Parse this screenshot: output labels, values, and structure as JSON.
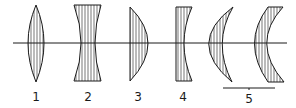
{
  "diagram": {
    "axis": {
      "x1": 13,
      "x2": 287,
      "y": 43
    },
    "lenses": [
      {
        "id": "1",
        "label": "1",
        "shape": "biconvex",
        "label_x": 36
      },
      {
        "id": "2",
        "label": "2",
        "shape": "biconcave",
        "label_x": 88
      },
      {
        "id": "3",
        "label": "3",
        "shape": "plano-convex",
        "label_x": 138
      },
      {
        "id": "4",
        "label": "4",
        "shape": "plano-concave",
        "label_x": 183
      },
      {
        "id": "5a",
        "label": "",
        "shape": "positive-meniscus",
        "label_x": 220
      },
      {
        "id": "5b",
        "label": "",
        "shape": "negative-meniscus",
        "label_x": 272
      }
    ],
    "group_bracket": {
      "label": "5",
      "x1": 223,
      "x2": 275,
      "y": 88,
      "label_x": 249
    },
    "colors": {
      "stroke": "#1a1a1a",
      "background": "#ffffff"
    }
  }
}
